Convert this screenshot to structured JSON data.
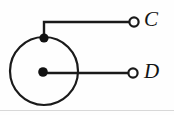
{
  "figure": {
    "kind": "circuit-diagram",
    "background_color": "#fefefe",
    "line_color": "#1a1a1a",
    "width": 174,
    "height": 115
  },
  "loop": {
    "name": "conductor-circle",
    "center_x": 44,
    "center_y": 71,
    "radius": 34
  },
  "nodes": [
    {
      "name": "top-junction-node",
      "label": "",
      "x": 44,
      "y": 38,
      "radius": 4.6
    },
    {
      "name": "center-node",
      "label": "",
      "x": 43,
      "y": 72,
      "radius": 4.8
    }
  ],
  "terminals": [
    {
      "name": "terminal-c",
      "label": "C",
      "x": 134,
      "y": 22,
      "radius": 4.6
    },
    {
      "name": "terminal-d",
      "label": "D",
      "x": 133,
      "y": 73,
      "radius": 4.6
    }
  ],
  "wires": [
    {
      "name": "wire-to-c",
      "from": "top-junction-node",
      "to": "terminal-c",
      "path": "M 44 38 L 44 22 L 129 22"
    },
    {
      "name": "wire-to-d",
      "from": "center-node",
      "to": "terminal-d",
      "path": "M 43 73 L 128 73"
    }
  ],
  "labels": {
    "c": "C",
    "d": "D"
  }
}
